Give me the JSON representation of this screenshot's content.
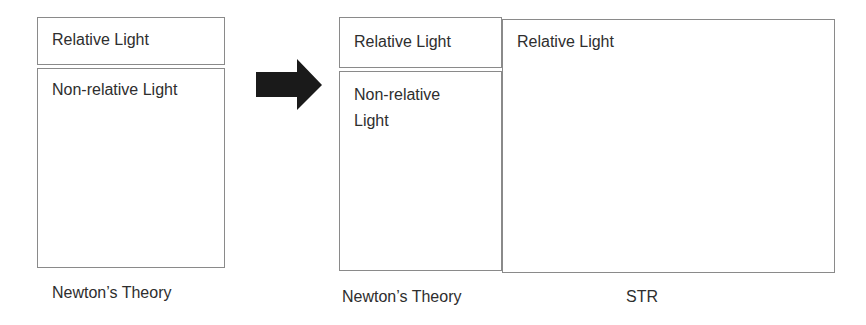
{
  "left_diagram": {
    "top_box_label": "Relative Light",
    "bottom_box_label": "Non-relative Light",
    "caption": "Newton’s Theory"
  },
  "arrow": {
    "icon": "right-arrow-icon",
    "color": "#1a1a1a"
  },
  "right_diagram": {
    "newton": {
      "top_box_label": "Relative Light",
      "bottom_box_label": "Non-relative Light",
      "caption": "Newton’s Theory"
    },
    "str": {
      "box_label": "Relative Light",
      "caption": "STR"
    }
  },
  "colors": {
    "border": "#8a8a8a",
    "text": "#2e2e2e"
  }
}
